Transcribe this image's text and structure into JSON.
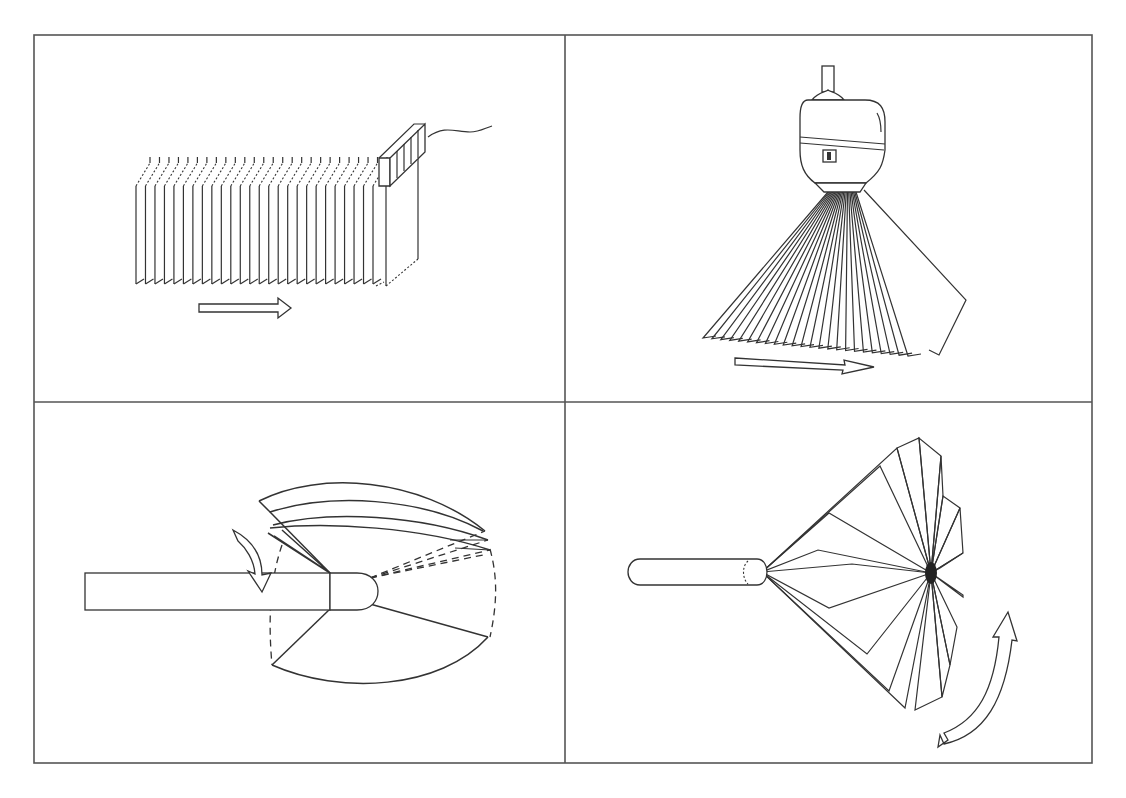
{
  "figure": {
    "layout": "2x2 grid",
    "frame_color": "#555555",
    "line_color": "#333333",
    "background": "#ffffff",
    "panels": [
      {
        "id": "top-left",
        "description": "Linear array of parallel scan planes with transducer moved along direction arrow",
        "motion": "linear-translation"
      },
      {
        "id": "top-right",
        "description": "Probe with fan of scan planes swept sideways (tilt sweep)",
        "motion": "fan-tilt"
      },
      {
        "id": "bottom-left",
        "description": "Rod probe with sector planes rotated about the probe axis (curved arrow)",
        "motion": "rotation-about-axis"
      },
      {
        "id": "bottom-right",
        "description": "Rod probe with planes radiating and rotating about a focal point (curved double arrow)",
        "motion": "rotational-fan"
      }
    ]
  }
}
